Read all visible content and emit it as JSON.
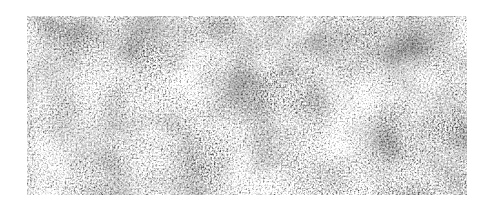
{
  "image": {
    "alt": "Grayscale micrograph of a dense fibrous network",
    "colors": {
      "background": "#ffffff",
      "dark": "#1a1a1a",
      "light": "#e8e8e8"
    }
  }
}
